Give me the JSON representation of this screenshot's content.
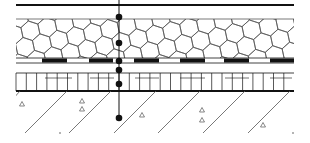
{
  "diagram": {
    "type": "construction-section",
    "colors": {
      "ink": "#111111",
      "fine": "#555555",
      "background": "#ffffff"
    },
    "layers": [
      {
        "name": "top-membrane",
        "style": "thick-line",
        "y": 5
      },
      {
        "name": "insulation-hexagon",
        "style": "hexagon-hatch",
        "y_top": 19,
        "y_bottom": 58
      },
      {
        "name": "dashed-strip",
        "style": "black-white-bars",
        "y_top": 58,
        "y_bottom": 63
      },
      {
        "name": "grid-layer",
        "style": "vertical-grid",
        "y_top": 73,
        "y_bottom": 91
      },
      {
        "name": "concrete-slab",
        "style": "diagonal-hatch-with-triangles",
        "y_top": 91,
        "y_bottom": 134
      }
    ],
    "measurement_line": {
      "x": 119,
      "points_y": [
        17,
        43,
        61,
        70,
        84,
        118
      ]
    },
    "bars_x": [
      [
        42,
        67
      ],
      [
        89,
        113
      ],
      [
        134,
        159
      ],
      [
        180,
        205
      ],
      [
        224,
        249
      ],
      [
        270,
        294
      ]
    ],
    "diagonals_x_bottom": [
      25,
      69,
      114,
      158,
      203,
      248
    ],
    "triangles": [
      [
        22,
        104
      ],
      [
        82,
        101
      ],
      [
        82,
        109
      ],
      [
        142,
        115
      ],
      [
        202,
        110
      ],
      [
        202,
        120
      ],
      [
        263,
        125
      ]
    ]
  }
}
